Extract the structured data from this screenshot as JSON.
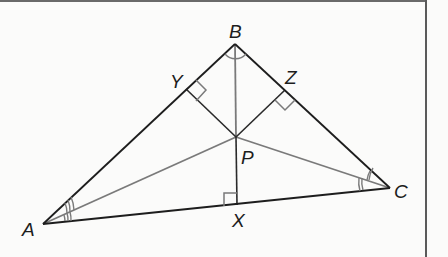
{
  "diagram": {
    "type": "geometry",
    "colors": {
      "triangle": "#1d1d1d",
      "bisector": "#7a7a7a",
      "border": "#5a5a5a",
      "background": "#fbfbfa"
    },
    "points": {
      "A": {
        "label": "A",
        "x": 43,
        "y": 224
      },
      "B": {
        "label": "B",
        "x": 235,
        "y": 44
      },
      "C": {
        "label": "C",
        "x": 390,
        "y": 188
      },
      "P": {
        "label": "P",
        "x": 236,
        "y": 137
      },
      "X": {
        "label": "X",
        "x": 237,
        "y": 205
      },
      "Y": {
        "label": "Y",
        "x": 186,
        "y": 89
      },
      "Z": {
        "label": "Z",
        "x": 285,
        "y": 90
      }
    },
    "labels": {
      "A": "A",
      "B": "B",
      "C": "C",
      "P": "P",
      "X": "X",
      "Y": "Y",
      "Z": "Z"
    },
    "segments": {
      "sides": [
        "AB",
        "BC",
        "CA"
      ],
      "angle_bisectors": [
        "AP",
        "BP",
        "CP"
      ],
      "perpendiculars": [
        "PX",
        "PY",
        "PZ"
      ]
    },
    "markings": {
      "right_angles": [
        "X",
        "Y",
        "Z"
      ],
      "angle_A": "triple arc (congruent halves)",
      "angle_B": "single arc (congruent halves)",
      "angle_C": "double arc (congruent halves)"
    }
  }
}
